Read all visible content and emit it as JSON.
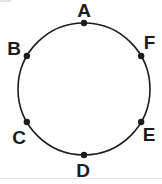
{
  "figure": {
    "width": 162,
    "height": 184,
    "background": "#ffffff",
    "ink_color": "#1c1c1c",
    "artifact_color": "#e2e2e2",
    "circle": {
      "cx": 84,
      "cy": 89,
      "r": 66,
      "stroke_width": 1.6
    },
    "dot_radius": 3.2,
    "points": [
      {
        "label": "A",
        "angle_deg": 90,
        "dot_x": 84,
        "dot_y": 23,
        "label_x": 84,
        "label_y": 10
      },
      {
        "label": "B",
        "angle_deg": 150,
        "dot_x": 26.84,
        "dot_y": 56,
        "label_x": 14,
        "label_y": 48
      },
      {
        "label": "C",
        "angle_deg": 210,
        "dot_x": 26.84,
        "dot_y": 122,
        "label_x": 19,
        "label_y": 137
      },
      {
        "label": "D",
        "angle_deg": 270,
        "dot_x": 84,
        "dot_y": 155,
        "label_x": 83,
        "label_y": 170
      },
      {
        "label": "E",
        "angle_deg": 330,
        "dot_x": 141.16,
        "dot_y": 122,
        "label_x": 149,
        "label_y": 134
      },
      {
        "label": "F",
        "angle_deg": 30,
        "dot_x": 141.16,
        "dot_y": 56,
        "label_x": 149.5,
        "label_y": 42
      }
    ],
    "artifacts": {
      "bottom_line_y": 178,
      "corner_mark": {
        "x": 0,
        "y": 0,
        "width": 11,
        "height": 2
      }
    }
  }
}
